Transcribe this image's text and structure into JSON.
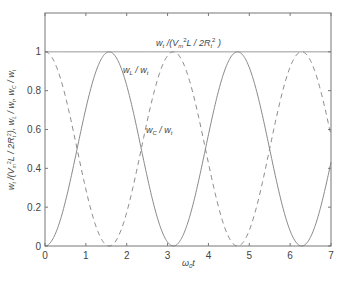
{
  "chart_data": {
    "type": "line",
    "title": "",
    "xlabel": "ω0t",
    "ylabel": "wt /(Vm²L / 2Rt²), wL / wt, wC / wt",
    "xlim": [
      0,
      7
    ],
    "ylim": [
      0,
      1.2
    ],
    "grid": false,
    "legend": "none (inline annotations)",
    "x_ticks": [
      0,
      1,
      2,
      3,
      4,
      5,
      6,
      7
    ],
    "y_ticks": [
      0,
      0.2,
      0.4,
      0.6,
      0.8,
      1
    ],
    "y_tick_labels": [
      "0",
      "0.2",
      "0.4",
      "0.6",
      "0.8",
      "1"
    ],
    "series": [
      {
        "name": "wt /(Vm²L / 2Rt²)",
        "style": "solid",
        "color": "#8a8a8a",
        "function": "1",
        "x": [
          0,
          7
        ],
        "values": [
          1,
          1
        ]
      },
      {
        "name": "wL / wt",
        "style": "solid",
        "color": "#8a8a8a",
        "function": "sin^2(ω0t)",
        "x": [
          0,
          0.785,
          1.571,
          2.356,
          3.142,
          3.927,
          4.712,
          5.498,
          6.283,
          7.0
        ],
        "values": [
          0,
          0.5,
          1,
          0.5,
          0,
          0.5,
          1,
          0.5,
          0,
          0.43
        ]
      },
      {
        "name": "wC / wt",
        "style": "dashed",
        "color": "#8a8a8a",
        "function": "cos^2(ω0t)",
        "x": [
          0,
          0.785,
          1.571,
          2.356,
          3.142,
          3.927,
          4.712,
          5.498,
          6.283,
          7.0
        ],
        "values": [
          1,
          0.5,
          0,
          0.5,
          1,
          0.5,
          0,
          0.5,
          1,
          0.57
        ]
      }
    ],
    "annotations": [
      {
        "text": "wt /(Vm²L / 2Rt²)",
        "x": 3.1,
        "y": 1.05
      },
      {
        "text": "wL / wt",
        "x": 2.0,
        "y": 0.89
      },
      {
        "text": "wC / wt",
        "x": 2.5,
        "y": 0.58
      }
    ]
  },
  "labels": {
    "xlabel_main": "ω",
    "xlabel_sub": "0",
    "xlabel_tail": "t",
    "ylabel_text": "w t /(V m 2L / 2R t 2), w L / w t, w C / w t",
    "anno_total": "w",
    "anno_total_sub": "t",
    "anno_total_rest": " /(V",
    "anno_total_m": "m",
    "anno_total_sup": "2",
    "anno_total_L": "L / 2R",
    "anno_total_t": "t",
    "anno_total_sup2": "2",
    "anno_total_close": " )",
    "anno_L": "w",
    "anno_L_sub": "L",
    "anno_L_mid": " / w",
    "anno_L_sub2": "t",
    "anno_C": "w",
    "anno_C_sub": "C",
    "anno_C_mid": " / w",
    "anno_C_sub2": "t"
  },
  "colors": {
    "axes": "#777777",
    "line": "#8a8a8a",
    "text": "#444444"
  }
}
